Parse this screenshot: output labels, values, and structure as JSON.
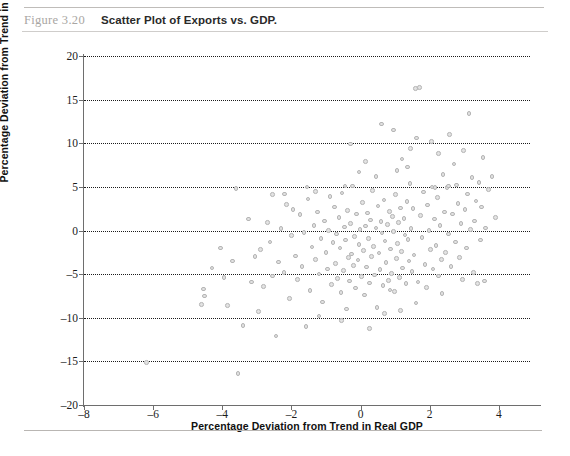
{
  "figure": {
    "label": "Figure 3.20",
    "title": "Scatter Plot of Exports vs. GDP."
  },
  "chart_data": {
    "type": "scatter",
    "title": "Scatter Plot of Exports vs. GDP.",
    "xlabel": "Percentage Deviation from Trend in Real GDP",
    "ylabel": "Percentage Deviation from Trend in Exports",
    "xlim": [
      -8,
      4.9
    ],
    "ylim": [
      -20,
      20
    ],
    "xticks": [
      -8,
      -6,
      -4,
      -2,
      0,
      2,
      4
    ],
    "xtick_labels": [
      "–8",
      "–6",
      "–4",
      "–2",
      "0",
      "2",
      "4"
    ],
    "yticks": [
      -20,
      -15,
      -10,
      -5,
      0,
      5,
      10,
      15,
      20
    ],
    "ytick_labels": [
      "–20",
      "–15",
      "–10",
      "–5",
      "0",
      "5",
      "10",
      "15",
      "20"
    ],
    "grid": "horizontal-dotted",
    "legend": "none",
    "marker_color": "#e2e2e2",
    "marker_edge_color": "#b4b4b4",
    "points": [
      [
        -6.2,
        -15.1
      ],
      [
        -4.6,
        -8.5
      ],
      [
        -4.55,
        -6.7
      ],
      [
        -4.52,
        -7.5
      ],
      [
        -4.3,
        -4.3
      ],
      [
        -3.95,
        -5.4
      ],
      [
        -3.85,
        -8.6
      ],
      [
        -3.6,
        4.8
      ],
      [
        -3.55,
        -16.4
      ],
      [
        -3.4,
        -10.9
      ],
      [
        -3.25,
        1.3
      ],
      [
        -3.15,
        -5.9
      ],
      [
        -3.05,
        -3.0
      ],
      [
        -2.9,
        -2.2
      ],
      [
        -2.8,
        -6.4
      ],
      [
        -2.7,
        0.9
      ],
      [
        -2.62,
        -1.3
      ],
      [
        -2.55,
        -5.2
      ],
      [
        -2.45,
        -12.1
      ],
      [
        -2.38,
        -3.6
      ],
      [
        -2.3,
        0.2
      ],
      [
        -2.22,
        -4.8
      ],
      [
        -2.15,
        3.0
      ],
      [
        -2.05,
        -7.8
      ],
      [
        -2.0,
        -0.6
      ],
      [
        -1.95,
        2.4
      ],
      [
        -1.88,
        -2.9
      ],
      [
        -1.82,
        -5.6
      ],
      [
        -1.75,
        1.8
      ],
      [
        -1.7,
        -4.1
      ],
      [
        -1.64,
        -0.2
      ],
      [
        -1.58,
        -11.0
      ],
      [
        -1.52,
        3.6
      ],
      [
        -1.46,
        -6.9
      ],
      [
        -1.4,
        -1.9
      ],
      [
        -1.35,
        0.6
      ],
      [
        -1.3,
        -3.3
      ],
      [
        -1.25,
        2.1
      ],
      [
        -1.2,
        -5.0
      ],
      [
        -1.15,
        -0.9
      ],
      [
        -1.1,
        -8.2
      ],
      [
        -1.05,
        1.1
      ],
      [
        -1.0,
        -2.5
      ],
      [
        -0.96,
        -4.4
      ],
      [
        -0.92,
        0.0
      ],
      [
        -0.88,
        3.9
      ],
      [
        -0.84,
        -6.2
      ],
      [
        -0.8,
        -1.4
      ],
      [
        -0.76,
        2.7
      ],
      [
        -0.73,
        -3.8
      ],
      [
        -0.7,
        -0.4
      ],
      [
        -0.66,
        -5.5
      ],
      [
        -0.63,
        1.5
      ],
      [
        -0.6,
        -2.0
      ],
      [
        -0.57,
        -7.1
      ],
      [
        -0.54,
        4.3
      ],
      [
        -0.5,
        -4.6
      ],
      [
        -0.47,
        0.4
      ],
      [
        -0.44,
        -1.1
      ],
      [
        -0.41,
        -9.0
      ],
      [
        -0.38,
        2.3
      ],
      [
        -0.35,
        -3.1
      ],
      [
        -0.32,
        -5.8
      ],
      [
        -0.29,
        0.8
      ],
      [
        -0.26,
        -2.7
      ],
      [
        -0.23,
        5.1
      ],
      [
        -0.2,
        -4.0
      ],
      [
        -0.17,
        -0.7
      ],
      [
        -0.14,
        -6.6
      ],
      [
        -0.11,
        1.9
      ],
      [
        -0.08,
        -3.4
      ],
      [
        -0.05,
        -1.6
      ],
      [
        -0.02,
        0.1
      ],
      [
        0.02,
        -5.3
      ],
      [
        0.05,
        3.2
      ],
      [
        0.08,
        -2.3
      ],
      [
        0.11,
        -7.4
      ],
      [
        0.14,
        0.5
      ],
      [
        0.17,
        -4.2
      ],
      [
        0.2,
        2.0
      ],
      [
        0.23,
        -0.9
      ],
      [
        0.26,
        -6.0
      ],
      [
        0.29,
        1.2
      ],
      [
        0.32,
        -3.0
      ],
      [
        0.35,
        4.6
      ],
      [
        0.38,
        -1.8
      ],
      [
        0.41,
        -5.1
      ],
      [
        0.44,
        0.3
      ],
      [
        0.47,
        -8.8
      ],
      [
        0.5,
        2.8
      ],
      [
        0.53,
        -2.6
      ],
      [
        0.56,
        -4.5
      ],
      [
        0.59,
        1.0
      ],
      [
        0.62,
        -0.3
      ],
      [
        0.65,
        -6.3
      ],
      [
        0.68,
        3.5
      ],
      [
        0.71,
        -1.2
      ],
      [
        0.74,
        -3.7
      ],
      [
        0.77,
        0.7
      ],
      [
        0.8,
        -5.7
      ],
      [
        0.83,
        2.2
      ],
      [
        0.86,
        -2.1
      ],
      [
        0.89,
        -4.9
      ],
      [
        0.92,
        1.6
      ],
      [
        0.95,
        -0.1
      ],
      [
        0.98,
        -7.0
      ],
      [
        1.01,
        4.1
      ],
      [
        1.04,
        -3.2
      ],
      [
        1.07,
        -1.5
      ],
      [
        1.1,
        0.9
      ],
      [
        1.13,
        -5.4
      ],
      [
        1.16,
        2.6
      ],
      [
        1.19,
        -2.4
      ],
      [
        1.22,
        -4.3
      ],
      [
        1.25,
        1.4
      ],
      [
        1.28,
        -0.5
      ],
      [
        1.31,
        -6.1
      ],
      [
        1.34,
        3.3
      ],
      [
        1.37,
        -1.0
      ],
      [
        1.4,
        -3.5
      ],
      [
        1.43,
        5.4
      ],
      [
        1.46,
        0.2
      ],
      [
        1.49,
        -4.7
      ],
      [
        1.52,
        2.5
      ],
      [
        1.55,
        -2.8
      ],
      [
        1.58,
        16.3
      ],
      [
        1.7,
        16.4
      ],
      [
        1.62,
        10.6
      ],
      [
        1.66,
        -5.9
      ],
      [
        1.74,
        1.7
      ],
      [
        1.78,
        -0.8
      ],
      [
        1.82,
        4.4
      ],
      [
        1.86,
        -3.9
      ],
      [
        1.9,
        -6.5
      ],
      [
        1.94,
        2.9
      ],
      [
        1.98,
        0.0
      ],
      [
        2.02,
        -2.2
      ],
      [
        2.06,
        5.0
      ],
      [
        2.1,
        -4.4
      ],
      [
        2.14,
        1.3
      ],
      [
        2.18,
        -1.7
      ],
      [
        2.22,
        3.8
      ],
      [
        2.26,
        -5.2
      ],
      [
        2.3,
        0.6
      ],
      [
        2.34,
        -3.3
      ],
      [
        2.38,
        6.4
      ],
      [
        2.42,
        2.1
      ],
      [
        2.46,
        -2.5
      ],
      [
        2.5,
        4.9
      ],
      [
        2.54,
        -0.4
      ],
      [
        2.58,
        11.0
      ],
      [
        2.62,
        -4.1
      ],
      [
        2.66,
        1.9
      ],
      [
        2.7,
        7.6
      ],
      [
        2.74,
        -1.3
      ],
      [
        2.78,
        5.2
      ],
      [
        2.82,
        3.1
      ],
      [
        2.86,
        -3.1
      ],
      [
        2.9,
        0.8
      ],
      [
        2.94,
        -5.6
      ],
      [
        2.98,
        9.2
      ],
      [
        3.02,
        2.4
      ],
      [
        3.06,
        -2.0
      ],
      [
        3.1,
        4.2
      ],
      [
        3.14,
        13.4
      ],
      [
        3.18,
        0.1
      ],
      [
        3.22,
        6.1
      ],
      [
        3.26,
        -4.8
      ],
      [
        3.3,
        1.1
      ],
      [
        3.34,
        3.4
      ],
      [
        3.38,
        -6.1
      ],
      [
        3.42,
        5.5
      ],
      [
        3.46,
        -1.1
      ],
      [
        3.5,
        2.7
      ],
      [
        3.54,
        8.4
      ],
      [
        3.58,
        -5.8
      ],
      [
        3.62,
        0.3
      ],
      [
        3.7,
        4.7
      ],
      [
        3.8,
        6.2
      ],
      [
        3.9,
        1.5
      ],
      [
        0.6,
        12.2
      ],
      [
        0.95,
        11.5
      ],
      [
        1.2,
        8.2
      ],
      [
        1.45,
        9.4
      ],
      [
        2.05,
        10.2
      ],
      [
        2.25,
        8.8
      ],
      [
        0.15,
        7.9
      ],
      [
        -0.3,
        9.9
      ],
      [
        -0.05,
        6.7
      ],
      [
        0.45,
        6.2
      ],
      [
        1.05,
        6.9
      ],
      [
        1.35,
        7.3
      ],
      [
        -1.55,
        5.0
      ],
      [
        -0.45,
        5.1
      ],
      [
        2.55,
        5.1
      ],
      [
        2.15,
        4.9
      ],
      [
        -2.55,
        4.1
      ],
      [
        -2.2,
        4.2
      ],
      [
        -1.3,
        4.5
      ],
      [
        0.7,
        -9.5
      ],
      [
        1.15,
        -9.2
      ],
      [
        -0.55,
        -10.3
      ],
      [
        0.25,
        -11.2
      ],
      [
        1.6,
        -8.3
      ],
      [
        -2.95,
        -9.3
      ],
      [
        2.35,
        -7.2
      ],
      [
        -1.2,
        -9.8
      ],
      [
        0.85,
        -6.8
      ],
      [
        -3.7,
        -3.5
      ],
      [
        -4.05,
        -2.0
      ]
    ]
  }
}
